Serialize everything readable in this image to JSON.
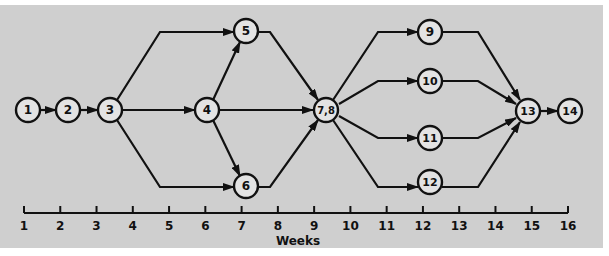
{
  "diagram": {
    "type": "network-schedule",
    "colors": {
      "background": "#cfcfcf",
      "line": "#111111",
      "node_fill": "#e3e3e3"
    },
    "nodes": [
      {
        "id": "n1",
        "label": "1",
        "x": 28,
        "y": 110
      },
      {
        "id": "n2",
        "label": "2",
        "x": 68,
        "y": 110
      },
      {
        "id": "n3",
        "label": "3",
        "x": 110,
        "y": 110
      },
      {
        "id": "n4",
        "label": "4",
        "x": 207,
        "y": 110
      },
      {
        "id": "n5",
        "label": "5",
        "x": 246,
        "y": 31
      },
      {
        "id": "n6",
        "label": "6",
        "x": 246,
        "y": 186
      },
      {
        "id": "n78",
        "label": "7,8",
        "x": 326,
        "y": 110
      },
      {
        "id": "n9",
        "label": "9",
        "x": 430,
        "y": 32
      },
      {
        "id": "n10",
        "label": "10",
        "x": 430,
        "y": 81
      },
      {
        "id": "n11",
        "label": "11",
        "x": 430,
        "y": 138
      },
      {
        "id": "n12",
        "label": "12",
        "x": 430,
        "y": 182
      },
      {
        "id": "n13",
        "label": "13",
        "x": 528,
        "y": 111
      },
      {
        "id": "n14",
        "label": "14",
        "x": 570,
        "y": 111
      }
    ],
    "edges": [
      {
        "from": "1",
        "to": "2",
        "points": [
          [
            40,
            110
          ],
          [
            56,
            110
          ]
        ]
      },
      {
        "from": "2",
        "to": "3",
        "points": [
          [
            80,
            110
          ],
          [
            98,
            110
          ]
        ]
      },
      {
        "from": "3",
        "to": "5",
        "points": [
          [
            117,
            100
          ],
          [
            160,
            32
          ],
          [
            234,
            32
          ]
        ]
      },
      {
        "from": "3",
        "to": "4",
        "points": [
          [
            122,
            110
          ],
          [
            195,
            110
          ]
        ]
      },
      {
        "from": "3",
        "to": "6",
        "points": [
          [
            117,
            120
          ],
          [
            160,
            187
          ],
          [
            234,
            187
          ]
        ]
      },
      {
        "from": "4",
        "to": "5",
        "points": [
          [
            213,
            100
          ],
          [
            240,
            42
          ]
        ]
      },
      {
        "from": "4",
        "to": "7,8",
        "points": [
          [
            219,
            110
          ],
          [
            313,
            110
          ]
        ]
      },
      {
        "from": "4",
        "to": "6",
        "points": [
          [
            213,
            120
          ],
          [
            240,
            176
          ]
        ]
      },
      {
        "from": "5",
        "to": "7,8",
        "points": [
          [
            258,
            32
          ],
          [
            270,
            32
          ],
          [
            318,
            100
          ]
        ]
      },
      {
        "from": "6",
        "to": "7,8",
        "points": [
          [
            258,
            187
          ],
          [
            270,
            187
          ],
          [
            318,
            120
          ]
        ]
      },
      {
        "from": "7,8",
        "to": "9",
        "points": [
          [
            333,
            100
          ],
          [
            378,
            32
          ],
          [
            418,
            32
          ]
        ]
      },
      {
        "from": "7,8",
        "to": "10",
        "points": [
          [
            339,
            104
          ],
          [
            378,
            81
          ],
          [
            418,
            81
          ]
        ]
      },
      {
        "from": "7,8",
        "to": "11",
        "points": [
          [
            339,
            116
          ],
          [
            378,
            138
          ],
          [
            418,
            138
          ]
        ]
      },
      {
        "from": "7,8",
        "to": "12",
        "points": [
          [
            333,
            120
          ],
          [
            378,
            187
          ],
          [
            418,
            187
          ]
        ]
      },
      {
        "from": "9",
        "to": "13",
        "points": [
          [
            442,
            32
          ],
          [
            478,
            32
          ],
          [
            520,
            100
          ]
        ]
      },
      {
        "from": "10",
        "to": "13",
        "points": [
          [
            442,
            81
          ],
          [
            478,
            81
          ],
          [
            516,
            104
          ]
        ]
      },
      {
        "from": "11",
        "to": "13",
        "points": [
          [
            442,
            138
          ],
          [
            478,
            138
          ],
          [
            516,
            118
          ]
        ]
      },
      {
        "from": "12",
        "to": "13",
        "points": [
          [
            442,
            187
          ],
          [
            478,
            187
          ],
          [
            520,
            122
          ]
        ]
      },
      {
        "from": "13",
        "to": "14",
        "points": [
          [
            540,
            111
          ],
          [
            558,
            111
          ]
        ]
      }
    ],
    "axis": {
      "title": "Weeks",
      "ticks": [
        "1",
        "2",
        "3",
        "4",
        "5",
        "6",
        "7",
        "8",
        "9",
        "10",
        "11",
        "12",
        "13",
        "14",
        "15",
        "16"
      ],
      "x_start": 24,
      "x_end": 568,
      "y": 213
    }
  }
}
